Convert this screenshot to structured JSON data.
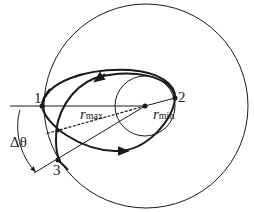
{
  "diagram": {
    "points": [
      {
        "id": "1",
        "label": "1"
      },
      {
        "id": "2",
        "label": "2"
      },
      {
        "id": "3",
        "label": "3"
      }
    ],
    "labels": {
      "r_max": {
        "main": "r",
        "sub": "max"
      },
      "r_min": {
        "main": "r",
        "sub": "min"
      },
      "delta_theta": "Δθ"
    },
    "colors": {
      "line": "#1a1a1a",
      "background": "#ffffff"
    }
  }
}
